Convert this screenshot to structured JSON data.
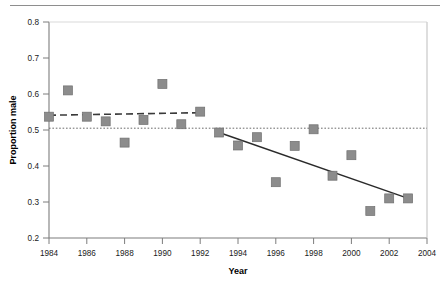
{
  "chart_data": {
    "type": "scatter",
    "title": "",
    "xlabel": "Year",
    "ylabel": "Proportion male",
    "xlim": [
      1984,
      2004
    ],
    "ylim": [
      0.2,
      0.8
    ],
    "xticks": [
      1984,
      1986,
      1988,
      1990,
      1992,
      1994,
      1996,
      1998,
      2000,
      2002,
      2004
    ],
    "yticks": [
      0.2,
      0.3,
      0.4,
      0.5,
      0.6,
      0.7,
      0.8
    ],
    "xtick_labels": [
      "1984",
      "1986",
      "1988",
      "1990",
      "1992",
      "1994",
      "1996",
      "1998",
      "2000",
      "2002",
      "2004"
    ],
    "ytick_labels": [
      "0.2",
      "0.3",
      "0.4",
      "0.5",
      "0.6",
      "0.7",
      "0.8"
    ],
    "grid": false,
    "legend": "none",
    "marker": {
      "shape": "square",
      "color": "#8c8c8c",
      "edge_color": "#6f6f6f",
      "size": 9
    },
    "x": [
      1984,
      1985,
      1986,
      1987,
      1988,
      1989,
      1990,
      1991,
      1992,
      1993,
      1994,
      1995,
      1996,
      1997,
      1998,
      1999,
      2000,
      2001,
      2002,
      2003
    ],
    "values": [
      0.537,
      0.61,
      0.537,
      0.524,
      0.465,
      0.528,
      0.628,
      0.516,
      0.551,
      0.493,
      0.457,
      0.48,
      0.355,
      0.456,
      0.502,
      0.373,
      0.43,
      0.275,
      0.31,
      0.31
    ],
    "points": [
      {
        "year": 1984,
        "proportion": 0.537
      },
      {
        "year": 1985,
        "proportion": 0.61
      },
      {
        "year": 1986,
        "proportion": 0.537
      },
      {
        "year": 1987,
        "proportion": 0.524
      },
      {
        "year": 1988,
        "proportion": 0.465
      },
      {
        "year": 1989,
        "proportion": 0.528
      },
      {
        "year": 1990,
        "proportion": 0.628
      },
      {
        "year": 1991,
        "proportion": 0.516
      },
      {
        "year": 1992,
        "proportion": 0.551
      },
      {
        "year": 1993,
        "proportion": 0.493
      },
      {
        "year": 1994,
        "proportion": 0.457
      },
      {
        "year": 1995,
        "proportion": 0.48
      },
      {
        "year": 1996,
        "proportion": 0.355
      },
      {
        "year": 1997,
        "proportion": 0.456
      },
      {
        "year": 1998,
        "proportion": 0.502
      },
      {
        "year": 1999,
        "proportion": 0.373
      },
      {
        "year": 2000,
        "proportion": 0.43
      },
      {
        "year": 2001,
        "proportion": 0.275
      },
      {
        "year": 2002,
        "proportion": 0.31
      },
      {
        "year": 2003,
        "proportion": 0.31
      }
    ],
    "annotations": [
      {
        "name": "early-period-trend",
        "style": "dashed",
        "color": "#3a3a3a",
        "x_start": 1984,
        "y_start": 0.541,
        "x_end": 1992,
        "y_end": 0.548
      },
      {
        "name": "late-period-trend",
        "style": "solid",
        "color": "#2a2a2a",
        "x_start": 1993,
        "y_start": 0.493,
        "x_end": 2003,
        "y_end": 0.31
      },
      {
        "name": "parity-reference-line",
        "style": "dotted",
        "color": "#6a6a6a",
        "y": 0.505,
        "x_start": 1984,
        "x_end": 2004
      }
    ]
  },
  "axes": {
    "x_title": "Year",
    "y_title": "Proportion male"
  }
}
